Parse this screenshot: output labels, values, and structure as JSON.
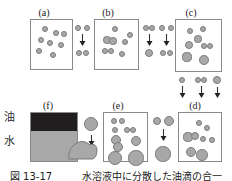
{
  "figure": {
    "caption": "図 13-17　　　水溶液中に分散した油滴の合一",
    "axis_labels": [
      {
        "text": "油",
        "name": "oil-label",
        "x": 4,
        "y": 112
      },
      {
        "text": "水",
        "name": "water-label",
        "x": 4,
        "y": 136
      }
    ]
  },
  "chart_data": {
    "type": "diagram",
    "stages": [
      "(a)",
      "(b)",
      "(c)",
      "(d)",
      "(e)",
      "(f)"
    ],
    "panels": [
      {
        "id": "panel-a",
        "label": "(a)",
        "label_x": 44,
        "label_y": 8,
        "x": 30,
        "y": 19,
        "w": 43,
        "h": 51,
        "droplets": [
          {
            "cx": 14,
            "cy": 9,
            "r": 3.0
          },
          {
            "cx": 25,
            "cy": 13,
            "r": 3.0
          },
          {
            "cx": 10,
            "cy": 20,
            "r": 3.0
          },
          {
            "cx": 19,
            "cy": 23,
            "r": 3.0
          },
          {
            "cx": 30,
            "cy": 25,
            "r": 3.0
          },
          {
            "cx": 8,
            "cy": 31,
            "r": 3.0
          },
          {
            "cx": 22,
            "cy": 35,
            "r": 3.0
          },
          {
            "cx": 33,
            "cy": 14,
            "r": 2.8
          }
        ]
      },
      {
        "id": "panel-b",
        "label": "(b)",
        "label_x": 108,
        "label_y": 8,
        "x": 94,
        "y": 19,
        "w": 45,
        "h": 51,
        "droplets": [
          {
            "cx": 20,
            "cy": 9,
            "r": 3.2
          },
          {
            "cx": 12,
            "cy": 20,
            "r": 3.6
          },
          {
            "cx": 18,
            "cy": 21,
            "r": 3.6
          },
          {
            "cx": 30,
            "cy": 22,
            "r": 3.2
          },
          {
            "cx": 10,
            "cy": 31,
            "r": 3.4
          },
          {
            "cx": 16,
            "cy": 31,
            "r": 3.4
          },
          {
            "cx": 27,
            "cy": 34,
            "r": 3.2
          },
          {
            "cx": 35,
            "cy": 15,
            "r": 3.0
          }
        ]
      },
      {
        "id": "panel-c",
        "label": "(c)",
        "label_x": 191,
        "label_y": 8,
        "x": 175,
        "y": 19,
        "w": 47,
        "h": 53,
        "droplets": [
          {
            "cx": 14,
            "cy": 11,
            "r": 3.2
          },
          {
            "cx": 27,
            "cy": 9,
            "r": 3.4
          },
          {
            "cx": 22,
            "cy": 19,
            "r": 3.6
          },
          {
            "cx": 13,
            "cy": 25,
            "r": 4.2
          },
          {
            "cx": 28,
            "cy": 26,
            "r": 3.4
          },
          {
            "cx": 34,
            "cy": 26,
            "r": 3.4
          },
          {
            "cx": 11,
            "cy": 37,
            "r": 4.6
          },
          {
            "cx": 28,
            "cy": 40,
            "r": 4.8
          }
        ]
      },
      {
        "id": "panel-d",
        "label": "(d)",
        "label_x": 195,
        "label_y": 101,
        "x": 178,
        "y": 112,
        "w": 44,
        "h": 50,
        "droplets": [
          {
            "cx": 20,
            "cy": 10,
            "r": 3.2
          },
          {
            "cx": 28,
            "cy": 15,
            "r": 3.4
          },
          {
            "cx": 9,
            "cy": 24,
            "r": 4.6
          },
          {
            "cx": 16,
            "cy": 23,
            "r": 4.2
          },
          {
            "cx": 24,
            "cy": 26,
            "r": 3.2
          },
          {
            "cx": 33,
            "cy": 27,
            "r": 3.0
          },
          {
            "cx": 12,
            "cy": 39,
            "r": 5.4
          },
          {
            "cx": 23,
            "cy": 42,
            "r": 5.8
          }
        ]
      },
      {
        "id": "panel-e",
        "label": "(e)",
        "label_x": 118,
        "label_y": 101,
        "x": 103,
        "y": 112,
        "w": 45,
        "h": 50,
        "droplets": [
          {
            "cx": 10,
            "cy": 8,
            "r": 3.2
          },
          {
            "cx": 18,
            "cy": 8,
            "r": 3.2
          },
          {
            "cx": 11,
            "cy": 17,
            "r": 3.4
          },
          {
            "cx": 23,
            "cy": 17,
            "r": 3.0
          },
          {
            "cx": 29,
            "cy": 17,
            "r": 3.0
          },
          {
            "cx": 12,
            "cy": 27,
            "r": 5.0
          },
          {
            "cx": 14,
            "cy": 34,
            "r": 5.2
          },
          {
            "cx": 32,
            "cy": 28,
            "r": 5.4
          },
          {
            "cx": 11,
            "cy": 45,
            "r": 7.4
          },
          {
            "cx": 32,
            "cy": 45,
            "r": 7.6
          }
        ]
      },
      {
        "id": "panel-f",
        "label": "(f)",
        "label_x": 48,
        "label_y": 101,
        "x": 30,
        "y": 112,
        "w": 48,
        "h": 50,
        "oil_height": 18,
        "water_height": 32
      }
    ],
    "transitions": [
      {
        "id": "transition-a-b",
        "label": "droplets approach and merge",
        "x": 74,
        "y": 24,
        "before": [
          {
            "cx": 4,
            "cy": 4,
            "r": 3.0
          },
          {
            "cx": 13,
            "cy": 4,
            "r": 3.0
          }
        ],
        "arrow": {
          "x": 8,
          "y": 10,
          "len": 12
        },
        "after": [
          {
            "cx": 5,
            "cy": 29,
            "r": 3.2
          },
          {
            "cx": 12,
            "cy": 29,
            "r": 3.2
          }
        ]
      },
      {
        "id": "transition-b-c-left",
        "label": "pair coalesces into one",
        "x": 142,
        "y": 24,
        "before": [
          {
            "cx": 4,
            "cy": 4,
            "r": 3.2
          },
          {
            "cx": 10,
            "cy": 4,
            "r": 3.2
          }
        ],
        "arrow": {
          "x": 7,
          "y": 10,
          "len": 12
        },
        "after": [
          {
            "cx": 7,
            "cy": 29,
            "r": 4.4
          }
        ]
      },
      {
        "id": "transition-b-c-right",
        "label": "droplets contact",
        "x": 158,
        "y": 24,
        "before": [
          {
            "cx": 4,
            "cy": 4,
            "r": 3.0
          },
          {
            "cx": 13,
            "cy": 4,
            "r": 3.0
          }
        ],
        "arrow": {
          "x": 8,
          "y": 10,
          "len": 12
        },
        "after": [
          {
            "cx": 5,
            "cy": 29,
            "r": 3.2
          },
          {
            "cx": 12,
            "cy": 29,
            "r": 3.2
          }
        ]
      },
      {
        "id": "transition-c-d-1",
        "label": "small droplet descends",
        "x": 178,
        "y": 76,
        "before": [
          {
            "cx": 4,
            "cy": 4,
            "r": 3.0
          }
        ],
        "arrow": {
          "x": 4,
          "y": 10,
          "len": 12
        },
        "after": []
      },
      {
        "id": "transition-c-d-2",
        "label": "droplet pair descends",
        "x": 194,
        "y": 76,
        "before": [
          {
            "cx": 4,
            "cy": 4,
            "r": 3.0
          },
          {
            "cx": 10,
            "cy": 4,
            "r": 3.0
          }
        ],
        "arrow": {
          "x": 7,
          "y": 10,
          "len": 12
        },
        "after": []
      },
      {
        "id": "transition-c-d-3",
        "label": "large droplet descends",
        "x": 212,
        "y": 76,
        "before": [
          {
            "cx": 5,
            "cy": 4,
            "r": 4.4
          }
        ],
        "arrow": {
          "x": 5,
          "y": 11,
          "len": 11
        },
        "after": []
      },
      {
        "id": "transition-d-e",
        "label": "droplets merge into larger drop",
        "x": 152,
        "y": 116,
        "before": [
          {
            "cx": 5,
            "cy": 5,
            "r": 4.4
          },
          {
            "cx": 17,
            "cy": 5,
            "r": 5.0
          }
        ],
        "arrow": {
          "x": 11,
          "y": 13,
          "len": 12
        },
        "after": [
          {
            "cx": 11,
            "cy": 38,
            "r": 7.6
          }
        ]
      },
      {
        "id": "transition-e-f",
        "label": "drop joins bulk oil phase",
        "x": 80,
        "y": 116,
        "before": [
          {
            "cx": 11,
            "cy": 8,
            "r": 7.4
          }
        ],
        "arrow": {
          "x": 11,
          "y": 19,
          "len": 11
        },
        "after": []
      }
    ],
    "pooled_blob": {
      "id": "coalesced-pool",
      "label": "coalesced oil pool",
      "x": 68,
      "y": 140,
      "w": 30,
      "h": 20
    }
  }
}
